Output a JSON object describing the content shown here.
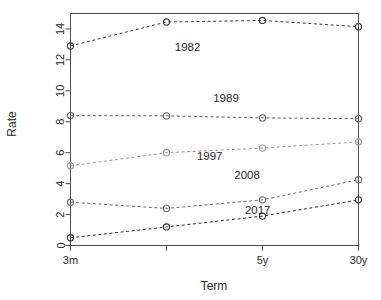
{
  "chart_data": {
    "type": "line",
    "title": "",
    "xlabel": "Term",
    "ylabel": "Rate",
    "x": [
      "3m",
      "1y",
      "5y",
      "30y"
    ],
    "x_tick_labels": [
      "3m",
      "",
      "5y",
      "30y"
    ],
    "xlim": [
      0,
      3
    ],
    "ylim": [
      0,
      15
    ],
    "y_ticks": [
      0,
      2,
      4,
      6,
      8,
      10,
      12,
      14
    ],
    "y_tick_labels": [
      "0",
      "2",
      "4",
      "6",
      "8",
      "10",
      "12",
      "14"
    ],
    "grid": false,
    "legend": "inline-annotations",
    "marker": "open-circle",
    "linestyle": "dashed",
    "series": [
      {
        "name": "1982",
        "values": [
          12.9,
          14.45,
          14.55,
          14.15
        ],
        "color": "#3a3a3a",
        "label_x": 1.22,
        "label_y": 12.55
      },
      {
        "name": "1989",
        "values": [
          8.4,
          8.38,
          8.25,
          8.2
        ],
        "color": "#5a5a5a",
        "label_x": 1.62,
        "label_y": 9.3
      },
      {
        "name": "1997",
        "values": [
          5.15,
          6.0,
          6.3,
          6.7
        ],
        "color": "#9a9a9a",
        "label_x": 1.45,
        "label_y": 5.5
      },
      {
        "name": "2008",
        "values": [
          2.8,
          2.4,
          2.95,
          4.25
        ],
        "color": "#6a6a6a",
        "label_x": 1.84,
        "label_y": 4.3
      },
      {
        "name": "2017",
        "values": [
          0.5,
          1.2,
          1.9,
          2.95
        ],
        "color": "#2e2e2e",
        "label_x": 1.95,
        "label_y": 2.05
      }
    ]
  },
  "axes": {
    "x_title": "Term",
    "y_title": "Rate"
  }
}
